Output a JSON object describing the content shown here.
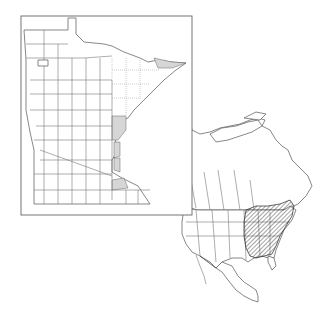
{
  "map": {
    "type": "species distribution map",
    "inset": {
      "region": "Minnesota",
      "division": "counties",
      "highlighted_color": "#d6d6d6",
      "highlighted_counties_count": 6
    },
    "continental": {
      "region": "North America",
      "range_fill": "hatched",
      "range_area": "eastern United States and southeastern Canada"
    }
  }
}
